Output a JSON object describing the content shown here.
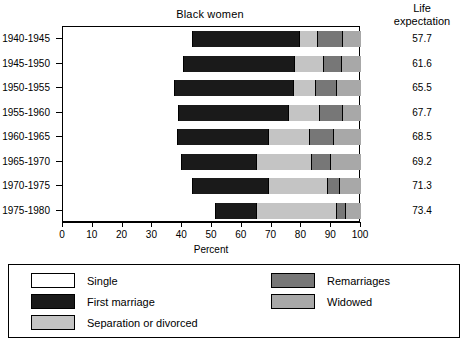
{
  "chart_data": {
    "type": "bar",
    "orientation": "horizontal",
    "stacked": true,
    "title": "Black women",
    "xlabel": "Percent",
    "ylabel": "",
    "xlim": [
      0,
      100
    ],
    "xticks": [
      0,
      10,
      20,
      30,
      40,
      50,
      60,
      70,
      80,
      90,
      100
    ],
    "xtick_labels": [
      "0",
      "10",
      "20",
      "30",
      "40",
      "50",
      "60",
      "70",
      "80",
      "90",
      "100"
    ],
    "grid": false,
    "legend_position": "below-plot",
    "categories": [
      "1940-1945",
      "1945-1950",
      "1950-1955",
      "1955-1960",
      "1960-1965",
      "1965-1970",
      "1970-1975",
      "1975-1980"
    ],
    "series": [
      {
        "name": "Single",
        "color": "#ffffff",
        "values": [
          43.5,
          40.5,
          37.5,
          38.8,
          38.5,
          40.0,
          43.5,
          51.3
        ]
      },
      {
        "name": "First marriage",
        "color": "#1a1a1a",
        "values": [
          36.0,
          37.3,
          40.0,
          37.0,
          30.5,
          25.0,
          25.5,
          13.7
        ]
      },
      {
        "name": "Separation or divorced",
        "color": "#c4c4c4",
        "values": [
          6.0,
          9.7,
          7.5,
          10.5,
          14.0,
          18.5,
          20.0,
          27.0
        ]
      },
      {
        "name": "Remarriages",
        "color": "#777777",
        "values": [
          8.5,
          6.3,
          7.0,
          7.7,
          8.0,
          6.5,
          4.0,
          3.0
        ]
      },
      {
        "name": "Widowed",
        "color": "#a8a8a8",
        "values": [
          6.0,
          6.2,
          8.0,
          6.0,
          9.0,
          10.0,
          7.0,
          5.0
        ]
      }
    ],
    "annotations": {
      "life_expectation_header": [
        "Life",
        "expectation"
      ],
      "life_expectation_values": [
        "57.7",
        "61.6",
        "65.5",
        "67.7",
        "68.5",
        "69.2",
        "71.3",
        "73.4"
      ]
    }
  },
  "legend": {
    "items": [
      {
        "label": "Single",
        "swatch": "single-swatch"
      },
      {
        "label": "First marriage",
        "swatch": "first-marriage-swatch"
      },
      {
        "label": "Separation or divorced",
        "swatch": "separation-swatch"
      },
      {
        "label": "Remarriages",
        "swatch": "remarriages-swatch"
      },
      {
        "label": "Widowed",
        "swatch": "widowed-swatch"
      }
    ]
  }
}
